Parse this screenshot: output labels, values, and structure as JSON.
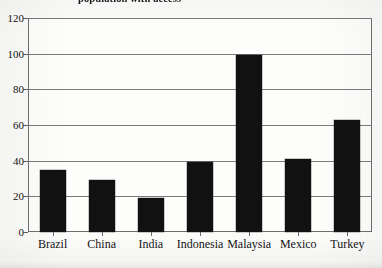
{
  "chart_data": {
    "type": "bar",
    "title": "population with access",
    "subtitle": "",
    "xlabel": "",
    "ylabel": "",
    "categories": [
      "Brazil",
      "China",
      "India",
      "Indonesia",
      "Malaysia",
      "Mexico",
      "Turkey"
    ],
    "values": [
      35,
      29,
      19,
      39,
      99,
      41,
      63
    ],
    "series": [
      {
        "name": "",
        "values": [
          35,
          29,
          19,
          39,
          99,
          41,
          63
        ]
      }
    ],
    "ylim": [
      0,
      120
    ],
    "ytick_labels": [
      "0",
      "20",
      "40",
      "60",
      "80",
      "100",
      "120"
    ],
    "ytick_values": [
      0,
      20,
      40,
      60,
      80,
      100,
      120
    ],
    "grid": true,
    "grid_axis": "y",
    "legend": false,
    "legend_position": "none",
    "bar_color": "#111111",
    "plot_background": "#fdfdfc",
    "axis_color": "#6e6e6e",
    "annotations": []
  }
}
